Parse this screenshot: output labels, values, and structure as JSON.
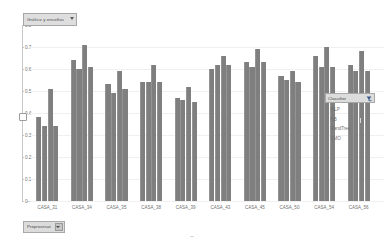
{
  "field_button": {
    "label": "Gráfico y enseñas",
    "icon": "chevron-down-icon"
  },
  "y_axis": {
    "ticks": [
      "0.8",
      "0.7",
      "0.6",
      "0.5",
      "0.4",
      "0.3",
      "0.2",
      "0.1",
      "0"
    ],
    "min": 0,
    "max": 0.8
  },
  "legend": {
    "title": "Classifier",
    "filter_icon": "filter-dropdown-icon",
    "items": [
      {
        "label": "MLP",
        "color": "#7f7f7f"
      },
      {
        "label": "NB",
        "color": "#7f7f7f"
      },
      {
        "label": "RandTree",
        "color": "#7f7f7f"
      },
      {
        "label": "SMO",
        "color": "#7f7f7f"
      }
    ]
  },
  "bottom_filter": {
    "label": "Preprocesat",
    "icon": "chevron-down-icon"
  },
  "chart_data": {
    "type": "bar",
    "title": "Gráfico y enseñas",
    "xlabel": "",
    "ylabel": "",
    "ylim": [
      0,
      0.8
    ],
    "grid": true,
    "legend_position": "right",
    "categories": [
      "CASA_31",
      "CASA_34",
      "CASA_35",
      "CASA_38",
      "CASA_39",
      "CASA_43",
      "CASA_45",
      "CASA_50",
      "CASA_54",
      "CASA_56"
    ],
    "series": [
      {
        "name": "MLP",
        "values": [
          0.38,
          0.64,
          0.53,
          0.54,
          0.47,
          0.6,
          0.63,
          0.57,
          0.66,
          0.62
        ]
      },
      {
        "name": "NB",
        "values": [
          0.34,
          0.6,
          0.49,
          0.54,
          0.46,
          0.62,
          0.61,
          0.55,
          0.61,
          0.59
        ]
      },
      {
        "name": "RandTree",
        "values": [
          0.51,
          0.71,
          0.59,
          0.62,
          0.52,
          0.66,
          0.69,
          0.59,
          0.7,
          0.68
        ]
      },
      {
        "name": "SMO",
        "values": [
          0.34,
          0.61,
          0.51,
          0.54,
          0.45,
          0.62,
          0.63,
          0.54,
          0.61,
          0.59
        ]
      }
    ]
  }
}
